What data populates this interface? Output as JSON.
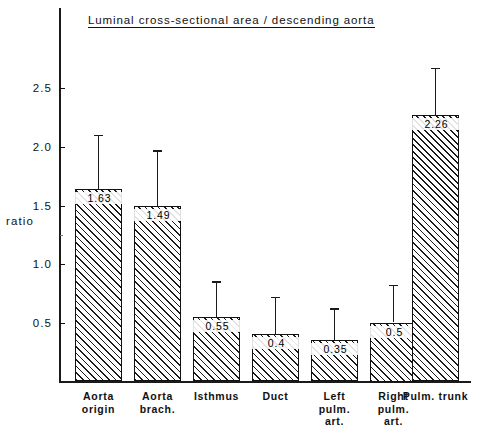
{
  "chart_data": {
    "type": "bar",
    "title": "Luminal cross-sectional area / descending aorta",
    "xlabel": "",
    "ylabel": "ratio",
    "ylim": [
      0,
      2.68
    ],
    "grid": false,
    "legend": "none",
    "ytick_labels": [
      "0.5",
      "1.0",
      "1.5",
      "2.0",
      "2.5"
    ],
    "ytick_values": [
      0.5,
      1.0,
      1.5,
      2.0,
      2.5
    ],
    "categories": [
      "Aorta\norigin",
      "Aorta\nbrach.",
      "Isthmus",
      "Duct",
      "Left\npulm.\nart.",
      "Right\npulm.\nart.",
      "Pulm. trunk"
    ],
    "values": [
      1.63,
      1.49,
      0.55,
      0.4,
      0.35,
      0.5,
      2.26
    ],
    "value_labels": [
      "1.63",
      "1.49",
      "0.55",
      "0.4",
      "0.35",
      "0.5",
      "2.26"
    ],
    "error_upper": [
      2.09,
      1.96,
      0.85,
      0.72,
      0.62,
      0.82,
      2.66
    ],
    "bar_fill": "diagonal-hatch",
    "colors": {
      "line": "#1a1a1a",
      "text": "#111111",
      "background": "#ffffff"
    }
  }
}
